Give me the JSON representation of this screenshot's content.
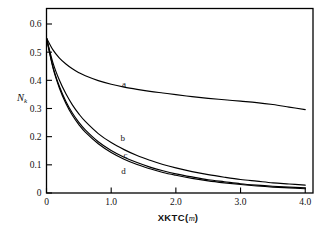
{
  "chart_data": {
    "type": "line",
    "title": "",
    "xlabel": "XKTC(m)",
    "xlabel_main": "XKTC(",
    "xlabel_unit": "m",
    "xlabel_close": ")",
    "ylabel": "Nk",
    "ylabel_main": "N",
    "ylabel_sub": "k",
    "xlim": [
      0,
      4.12
    ],
    "ylim": [
      0,
      0.655
    ],
    "xticks": [
      0,
      1.0,
      2.0,
      3.0,
      4.0
    ],
    "xtick_labels": [
      "0",
      "1.0",
      "2.0",
      "3.0",
      "4.0"
    ],
    "yticks": [
      0,
      0.1,
      0.2,
      0.3,
      0.4,
      0.5,
      0.6
    ],
    "ytick_labels": [
      "0",
      "0.1",
      "0.2",
      "0.3",
      "0.4",
      "0.5",
      "0.6"
    ],
    "grid": false,
    "legend_position": "inline-annotations",
    "line_color": "#000000",
    "axis_color": "#000000",
    "background": "#ffffff",
    "x": [
      0,
      0.1,
      0.2,
      0.3,
      0.4,
      0.5,
      0.6,
      0.8,
      1.0,
      1.2,
      1.4,
      1.6,
      1.8,
      2.0,
      2.25,
      2.5,
      2.75,
      3.0,
      3.25,
      3.5,
      3.75,
      4.0
    ],
    "series": [
      {
        "name": "a",
        "label": "a",
        "label_x": 1.2,
        "label_y": 0.375,
        "values": [
          0.55,
          0.508,
          0.479,
          0.458,
          0.441,
          0.427,
          0.416,
          0.399,
          0.386,
          0.376,
          0.368,
          0.361,
          0.355,
          0.349,
          0.342,
          0.336,
          0.331,
          0.326,
          0.321,
          0.314,
          0.305,
          0.296
        ]
      },
      {
        "name": "b",
        "label": "b",
        "label_x": 1.18,
        "label_y": 0.186,
        "values": [
          0.55,
          0.462,
          0.4,
          0.352,
          0.313,
          0.281,
          0.254,
          0.211,
          0.179,
          0.154,
          0.133,
          0.116,
          0.101,
          0.089,
          0.076,
          0.065,
          0.056,
          0.048,
          0.042,
          0.036,
          0.032,
          0.028
        ]
      },
      {
        "name": "c",
        "label": "c",
        "label_x": 1.22,
        "label_y": 0.126,
        "values": [
          0.55,
          0.448,
          0.378,
          0.325,
          0.284,
          0.251,
          0.224,
          0.182,
          0.151,
          0.127,
          0.108,
          0.092,
          0.079,
          0.068,
          0.057,
          0.047,
          0.04,
          0.033,
          0.028,
          0.024,
          0.021,
          0.018
        ]
      },
      {
        "name": "d",
        "label": "d",
        "label_x": 1.19,
        "label_y": 0.067,
        "values": [
          0.55,
          0.444,
          0.372,
          0.318,
          0.276,
          0.243,
          0.216,
          0.175,
          0.144,
          0.12,
          0.101,
          0.086,
          0.073,
          0.063,
          0.052,
          0.043,
          0.036,
          0.03,
          0.025,
          0.021,
          0.018,
          0.015
        ]
      }
    ]
  }
}
